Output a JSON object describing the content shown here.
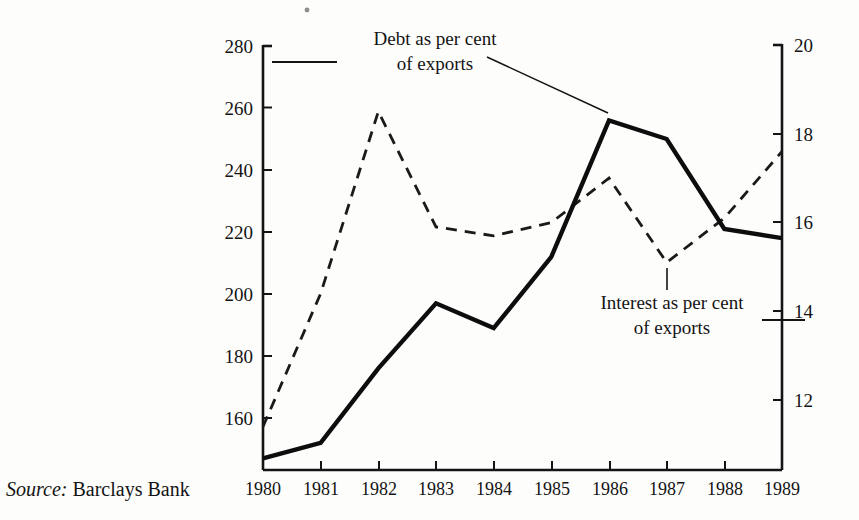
{
  "source": {
    "label": "Source:",
    "value": "Barclays Bank"
  },
  "annotations": {
    "debt": {
      "line1": "Debt as per cent",
      "line2": "of exports"
    },
    "interest": {
      "line1": "Interest as per cent",
      "line2": "of exports"
    }
  },
  "axes": {
    "left_ticks": [
      "280",
      "260",
      "240",
      "220",
      "200",
      "180",
      "160"
    ],
    "right_ticks": [
      "20",
      "18",
      "16",
      "14",
      "12"
    ],
    "x_ticks": [
      "1980",
      "1981",
      "1982",
      "1983",
      "1984",
      "1985",
      "1986",
      "1987",
      "1988",
      "1989"
    ]
  },
  "colors": {
    "ink": "#141414",
    "background": "#fdfdfc",
    "debt_line": "#0d0d0d",
    "interest_line": "#1a1a1a"
  },
  "chart_data": {
    "type": "line",
    "title": "",
    "subtitle": "",
    "xlabel": "",
    "ylabel": "Debt as per cent of exports",
    "y2label": "Interest as per cent of exports",
    "x": [
      "1980",
      "1981",
      "1982",
      "1983",
      "1984",
      "1985",
      "1986",
      "1987",
      "1988",
      "1989"
    ],
    "ylim": [
      140,
      280
    ],
    "y2lim": [
      11,
      20
    ],
    "left_ticks": [
      160,
      180,
      200,
      220,
      240,
      260,
      280
    ],
    "right_ticks": [
      12,
      14,
      16,
      18,
      20
    ],
    "grid": false,
    "legend": "annotations",
    "series": [
      {
        "name": "Debt as per cent of exports",
        "axis": "left",
        "style": "solid",
        "width": 4,
        "values": [
          147,
          152,
          176,
          197,
          189,
          212,
          256,
          250,
          221,
          218
        ]
      },
      {
        "name": "Interest as per cent of exports",
        "axis": "right",
        "style": "dashed",
        "width": 2.6,
        "values": [
          11.4,
          14.4,
          18.5,
          15.9,
          15.7,
          16.0,
          17.0,
          15.1,
          16.1,
          17.6
        ]
      }
    ],
    "annotations": [
      {
        "text": "Debt as per cent of exports",
        "target_x": "1986",
        "leader": true
      },
      {
        "text": "Interest as per cent of exports",
        "target_x": "1987",
        "leader": true
      }
    ]
  }
}
